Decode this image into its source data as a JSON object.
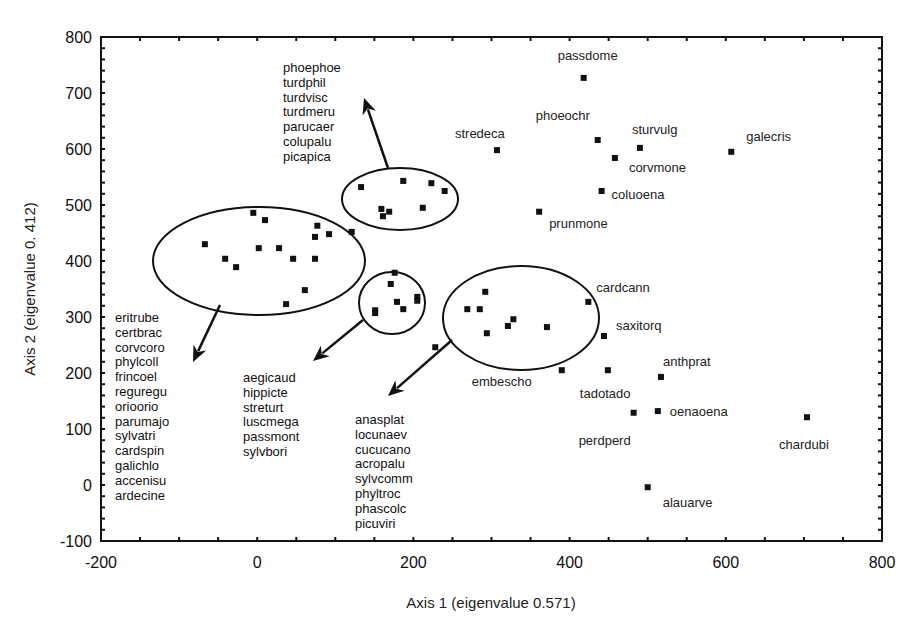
{
  "chart_data": {
    "type": "scatter",
    "title": "",
    "xlabel": "Axis 1 (eigenvalue 0.571)",
    "ylabel": "Axis 2 (eigenvalue 0. 412)",
    "xlim": [
      -200,
      800
    ],
    "ylim": [
      -100,
      800
    ],
    "xticks": [
      -200,
      0,
      200,
      400,
      600,
      800
    ],
    "yticks": [
      -100,
      0,
      100,
      200,
      300,
      400,
      500,
      600,
      700,
      800
    ],
    "grid": false,
    "legend": null,
    "labelled_points": [
      {
        "label": "passdome",
        "x": 418,
        "y": 727,
        "dx": -26,
        "dy": -18
      },
      {
        "label": "stredeca",
        "x": 307,
        "y": 598,
        "dx": -42,
        "dy": -12
      },
      {
        "label": "phoeochr",
        "x": 436,
        "y": 616,
        "dx": -62,
        "dy": -20
      },
      {
        "label": "sturvulg",
        "x": 490,
        "y": 602,
        "dx": -8,
        "dy": -14
      },
      {
        "label": "corvmone",
        "x": 458,
        "y": 584,
        "dx": 14,
        "dy": 14
      },
      {
        "label": "galecris",
        "x": 607,
        "y": 595,
        "dx": 15,
        "dy": -11
      },
      {
        "label": "coluoena",
        "x": 441,
        "y": 525,
        "dx": 10,
        "dy": 8
      },
      {
        "label": "prunmone",
        "x": 361,
        "y": 488,
        "dx": 10,
        "dy": 16
      },
      {
        "label": "cardcann",
        "x": 424,
        "y": 327,
        "dx": 8,
        "dy": -10
      },
      {
        "label": "saxitorq",
        "x": 444,
        "y": 266,
        "dx": 12,
        "dy": -6
      },
      {
        "label": "embescho",
        "x": 390,
        "y": 205,
        "dx": -90,
        "dy": 16
      },
      {
        "label": "tadotado",
        "x": 449,
        "y": 205,
        "dx": -28,
        "dy": 28
      },
      {
        "label": "anthprat",
        "x": 517,
        "y": 193,
        "dx": 2,
        "dy": -11
      },
      {
        "label": "oenaoena",
        "x": 513,
        "y": 132,
        "dx": 12,
        "dy": 5
      },
      {
        "label": "perdperd",
        "x": 482,
        "y": 129,
        "dx": -55,
        "dy": 32
      },
      {
        "label": "chardubi",
        "x": 704,
        "y": 121,
        "dx": -28,
        "dy": 32
      },
      {
        "label": "alauarve",
        "x": 500,
        "y": -4,
        "dx": 15,
        "dy": 20
      }
    ],
    "unlabelled_points": [
      {
        "x": -5,
        "y": 486
      },
      {
        "x": 10,
        "y": 473
      },
      {
        "x": 77,
        "y": 463
      },
      {
        "x": 92,
        "y": 448
      },
      {
        "x": 74,
        "y": 443
      },
      {
        "x": 121,
        "y": 452
      },
      {
        "x": -67,
        "y": 430
      },
      {
        "x": 2,
        "y": 423
      },
      {
        "x": 28,
        "y": 423
      },
      {
        "x": -41,
        "y": 404
      },
      {
        "x": 46,
        "y": 404
      },
      {
        "x": 74,
        "y": 404
      },
      {
        "x": -27,
        "y": 389
      },
      {
        "x": 61,
        "y": 348
      },
      {
        "x": 37,
        "y": 323
      },
      {
        "x": 133,
        "y": 532
      },
      {
        "x": 187,
        "y": 543
      },
      {
        "x": 223,
        "y": 539
      },
      {
        "x": 240,
        "y": 525
      },
      {
        "x": 159,
        "y": 493
      },
      {
        "x": 169,
        "y": 488
      },
      {
        "x": 161,
        "y": 480
      },
      {
        "x": 212,
        "y": 495
      },
      {
        "x": 176,
        "y": 379
      },
      {
        "x": 171,
        "y": 359
      },
      {
        "x": 205,
        "y": 336
      },
      {
        "x": 205,
        "y": 329
      },
      {
        "x": 179,
        "y": 327
      },
      {
        "x": 187,
        "y": 314
      },
      {
        "x": 151,
        "y": 312
      },
      {
        "x": 151,
        "y": 307
      },
      {
        "x": 292,
        "y": 345
      },
      {
        "x": 269,
        "y": 314
      },
      {
        "x": 285,
        "y": 314
      },
      {
        "x": 328,
        "y": 296
      },
      {
        "x": 321,
        "y": 284
      },
      {
        "x": 371,
        "y": 282
      },
      {
        "x": 294,
        "y": 271
      },
      {
        "x": 228,
        "y": 246
      }
    ],
    "groups": [
      {
        "name": "left-cluster",
        "ellipse": {
          "cx": 259,
          "cy": 261,
          "rx": 106,
          "ry": 54
        },
        "arrow": {
          "x1": 220,
          "y1": 305,
          "x2": 193,
          "y2": 362
        },
        "list_pos": {
          "x": 115,
          "y": 322
        },
        "members": [
          "eritrube",
          "certbrac",
          "corvcoro",
          "phylcoll",
          "frincoel",
          "reguregu",
          "orioorio",
          "parumajo",
          "sylvatri",
          "cardspin",
          "galichlo",
          "accenisu",
          "ardecine"
        ]
      },
      {
        "name": "top-cluster",
        "ellipse": {
          "cx": 400,
          "cy": 199,
          "rx": 58,
          "ry": 31
        },
        "arrow": {
          "x1": 388,
          "y1": 168,
          "x2": 364,
          "y2": 98
        },
        "list_pos": {
          "x": 283,
          "y": 72
        },
        "members": [
          "phoephoe",
          "turdphil",
          "turdvisc",
          "turdmeru",
          "parucaer",
          "colupalu",
          "picapica"
        ]
      },
      {
        "name": "small-cluster",
        "ellipse": {
          "cx": 392,
          "cy": 303,
          "rx": 33,
          "ry": 31
        },
        "arrow": {
          "x1": 363,
          "y1": 320,
          "x2": 313,
          "y2": 361
        },
        "list_pos": {
          "x": 243,
          "y": 382
        },
        "members": [
          "aegicaud",
          "hippicte",
          "streturt",
          "luscmega",
          "passmont",
          "sylvbori"
        ]
      },
      {
        "name": "right-cluster",
        "ellipse": {
          "cx": 521,
          "cy": 318,
          "rx": 78,
          "ry": 52
        },
        "arrow": {
          "x1": 452,
          "y1": 340,
          "x2": 388,
          "y2": 396
        },
        "list_pos": {
          "x": 355,
          "y": 424
        },
        "members": [
          "anasplat",
          "locunaev",
          "cucucano",
          "acropalu",
          "sylvcomm",
          "phyltroc",
          "phascolc",
          "picuviri"
        ]
      }
    ]
  },
  "colors": {
    "background": "#ffffff",
    "ink": "#111111",
    "text": "#222222"
  }
}
